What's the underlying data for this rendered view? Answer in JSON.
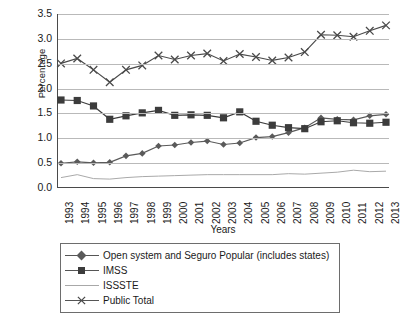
{
  "chart_data": {
    "type": "line",
    "title": "",
    "xlabel": "Years",
    "ylabel": "Percentage",
    "ylim": [
      0.0,
      3.5
    ],
    "ytick_labels": [
      "0.0",
      "0.5",
      "1.0",
      "1.5",
      "2.0",
      "2.5",
      "3.0",
      "3.5"
    ],
    "ytick_values": [
      0.0,
      0.5,
      1.0,
      1.5,
      2.0,
      2.5,
      3.0,
      3.5
    ],
    "grid": "horizontal",
    "legend_position": "bottom",
    "categories": [
      "1993",
      "1994",
      "1995",
      "1996",
      "1997",
      "1998",
      "1999",
      "2000",
      "2001",
      "2002",
      "2003",
      "2004",
      "2005",
      "2006",
      "2007",
      "2008",
      "2009",
      "2010",
      "2011",
      "2012",
      "2013"
    ],
    "series": [
      {
        "name": "Open system and Seguro Popular (includes states)",
        "marker": "diamond",
        "color": "#5a5a5a",
        "values": [
          0.48,
          0.51,
          0.49,
          0.5,
          0.63,
          0.68,
          0.83,
          0.85,
          0.9,
          0.93,
          0.86,
          0.89,
          1.0,
          1.02,
          1.1,
          1.2,
          1.4,
          1.37,
          1.36,
          1.44,
          1.47
        ]
      },
      {
        "name": "IMSS",
        "marker": "square",
        "color": "#3c3c3c",
        "values": [
          1.76,
          1.75,
          1.64,
          1.37,
          1.44,
          1.5,
          1.55,
          1.45,
          1.46,
          1.45,
          1.4,
          1.52,
          1.33,
          1.25,
          1.2,
          1.18,
          1.32,
          1.34,
          1.3,
          1.29,
          1.31
        ]
      },
      {
        "name": "ISSSTE",
        "marker": "none",
        "color": "#a8a8a8",
        "values": [
          0.19,
          0.25,
          0.17,
          0.16,
          0.19,
          0.21,
          0.22,
          0.23,
          0.24,
          0.25,
          0.25,
          0.25,
          0.25,
          0.25,
          0.27,
          0.26,
          0.28,
          0.3,
          0.34,
          0.31,
          0.32
        ]
      },
      {
        "name": "Public Total",
        "marker": "x",
        "color": "#4a4a4a",
        "values": [
          2.5,
          2.6,
          2.37,
          2.12,
          2.37,
          2.46,
          2.66,
          2.58,
          2.66,
          2.7,
          2.55,
          2.69,
          2.63,
          2.56,
          2.62,
          2.73,
          3.08,
          3.07,
          3.04,
          3.16,
          3.27
        ]
      }
    ]
  },
  "legend": {
    "items": [
      {
        "label": "Open system and Seguro Popular (includes states)"
      },
      {
        "label": "IMSS"
      },
      {
        "label": "ISSSTE"
      },
      {
        "label": "Public Total"
      }
    ]
  }
}
